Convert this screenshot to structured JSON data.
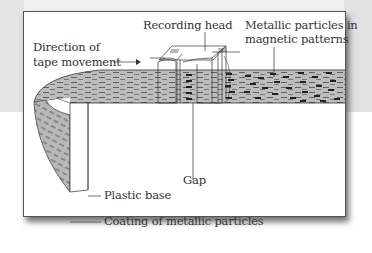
{
  "diagram": {
    "labels": {
      "direction_line1": "Direction of",
      "direction_line2": "tape movement",
      "recording_head": "Recording head",
      "particles_line1": "Metallic particles in",
      "particles_line2": "magnetic patterns",
      "gap": "Gap",
      "plastic_base": "Plastic base",
      "coating": "Coating of metallic particles"
    },
    "colors": {
      "tape_fill": "#bdbdbd",
      "tape_dash": "#555555",
      "magnetized_dash": "#111111",
      "line": "#333333",
      "card_border": "#555555",
      "background_gray": "#e3e3e3"
    }
  }
}
